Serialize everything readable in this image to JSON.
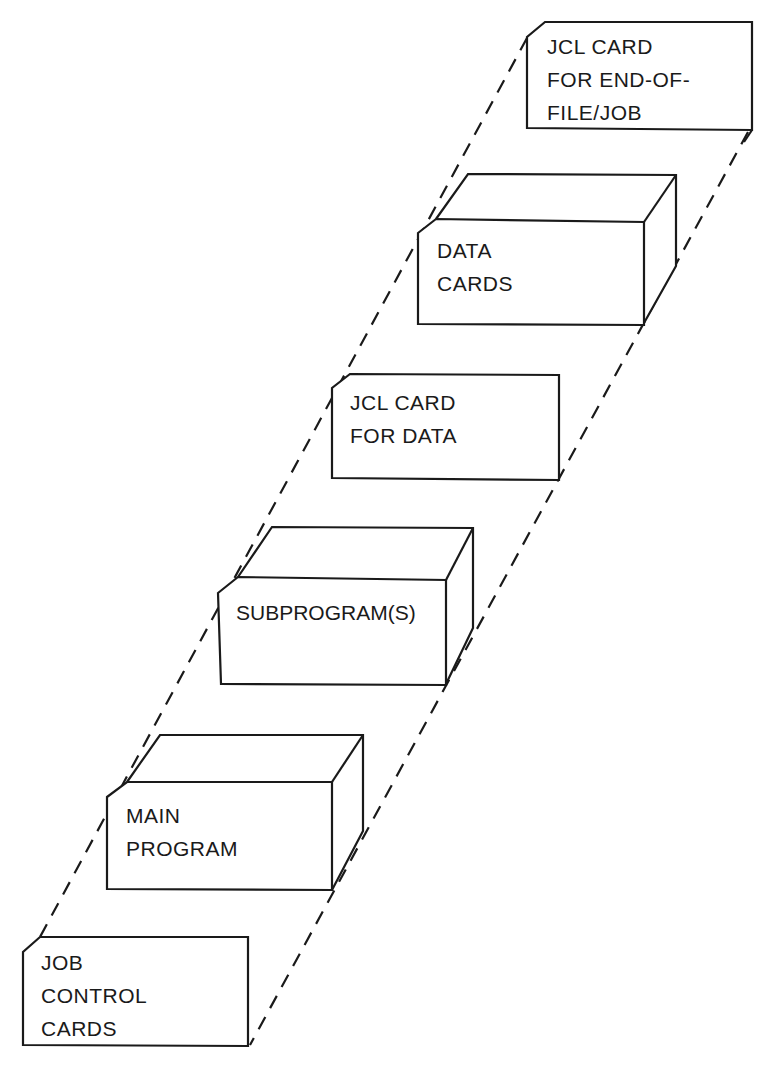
{
  "diagram": {
    "stroke_color": "#1a1a1a",
    "background": "#ffffff",
    "elements": [
      {
        "id": "jcl-end",
        "type": "card",
        "lines": [
          "JCL CARD",
          "FOR END-OF-",
          "FILE/JOB"
        ]
      },
      {
        "id": "data-cards",
        "type": "deck",
        "lines": [
          "DATA",
          "CARDS"
        ]
      },
      {
        "id": "jcl-data",
        "type": "card",
        "lines": [
          "JCL CARD",
          "FOR DATA"
        ]
      },
      {
        "id": "subprograms",
        "type": "deck",
        "lines": [
          "SUBPROGRAM(S)"
        ]
      },
      {
        "id": "main-program",
        "type": "deck",
        "lines": [
          "MAIN",
          "PROGRAM"
        ]
      },
      {
        "id": "job-control",
        "type": "card",
        "lines": [
          "JOB",
          "CONTROL",
          "CARDS"
        ]
      }
    ],
    "connectors": [
      {
        "id": "left-guide",
        "style": "dashed"
      },
      {
        "id": "right-guide",
        "style": "dashed"
      }
    ]
  }
}
